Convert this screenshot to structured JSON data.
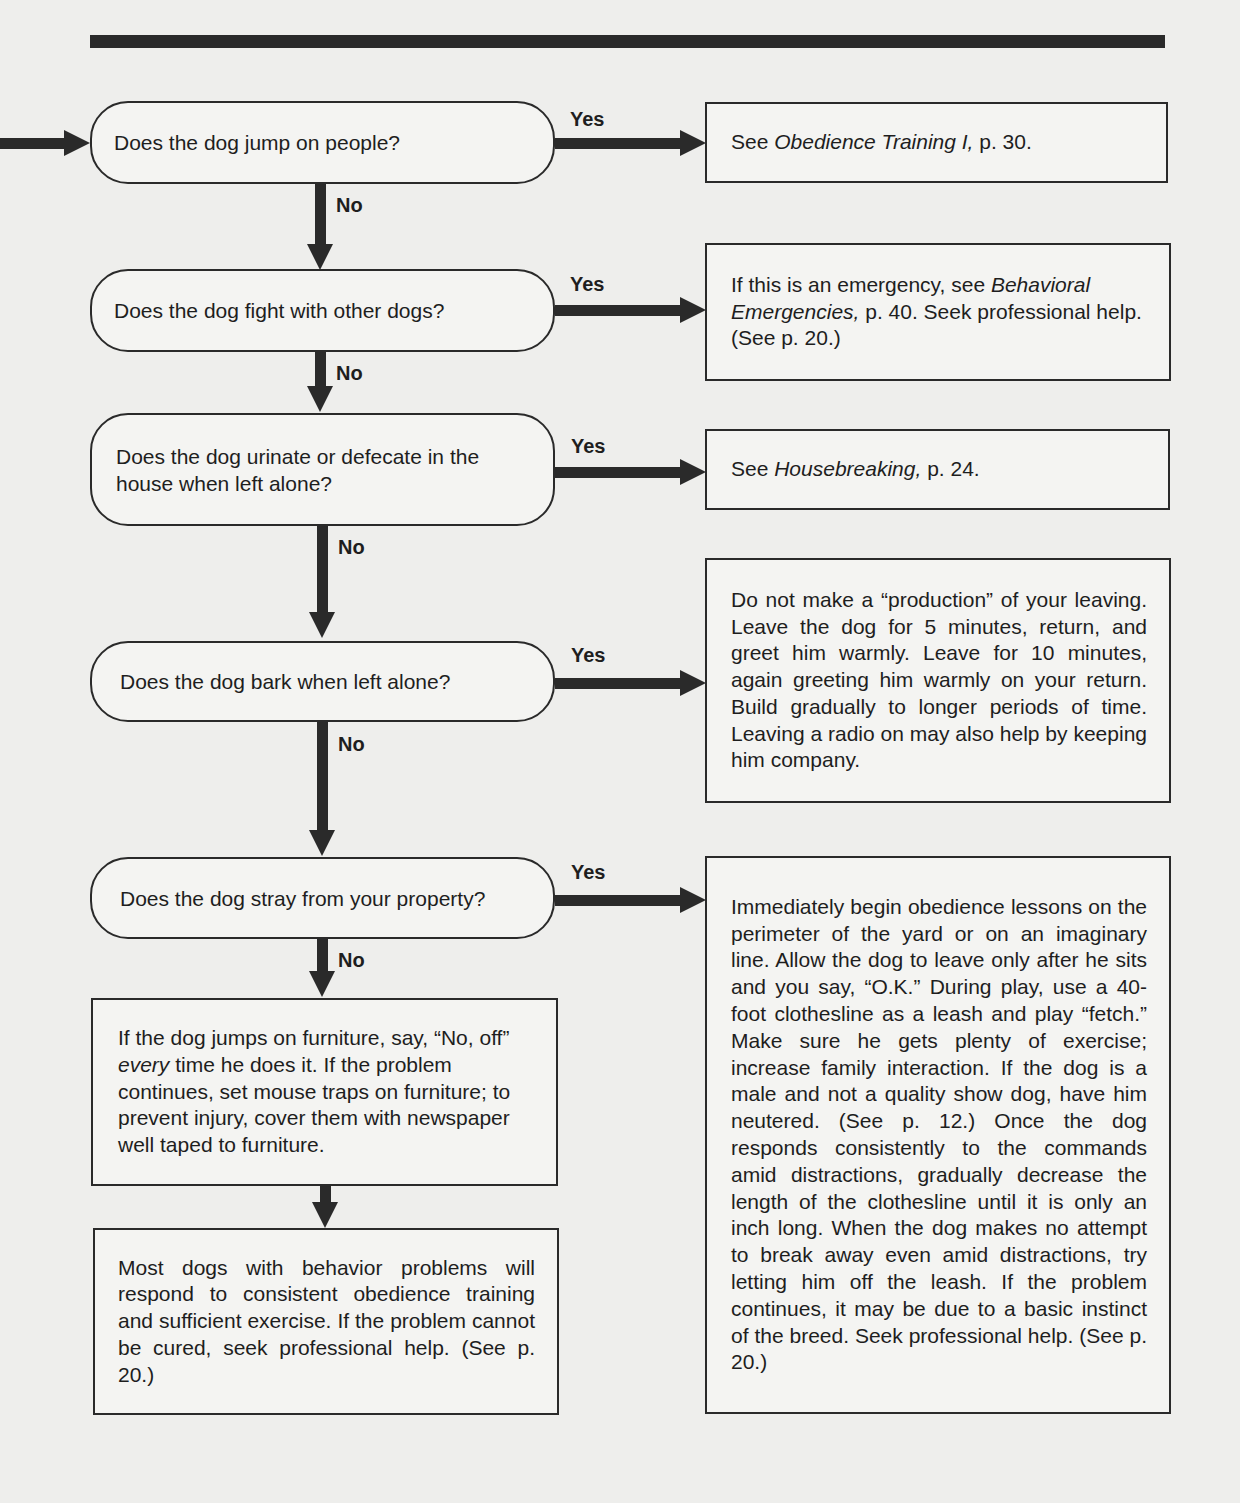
{
  "flowchart": {
    "questions": [
      {
        "text": "Does the dog jump on people?",
        "yes": "Yes",
        "no": "No"
      },
      {
        "text": "Does the dog fight with other dogs?",
        "yes": "Yes",
        "no": "No"
      },
      {
        "text": "Does the dog urinate or defecate in the house when left alone?",
        "yes": "Yes",
        "no": "No"
      },
      {
        "text": "Does the dog bark when left alone?",
        "yes": "Yes",
        "no": "No"
      },
      {
        "text": "Does the dog stray from your property?",
        "yes": "Yes",
        "no": "No"
      }
    ],
    "answers": [
      {
        "pre": "See ",
        "italic": "Obedience Training I,",
        "post": " p. 30."
      },
      {
        "pre": "If this is an emergency, see ",
        "italic": "Behavioral Emergencies,",
        "post": " p. 40. Seek professional help. (See p. 20.)"
      },
      {
        "pre": "See ",
        "italic": "Housebreaking,",
        "post": " p. 24."
      },
      {
        "text": "Do not make a “production” of your leaving. Leave the dog for 5 minutes, return, and greet him warmly. Leave for 10 minutes, again greeting him warmly on your return. Build gradually to longer periods of time. Leaving a radio on may also help by keeping him company."
      },
      {
        "text": "Immediately begin obedience lessons on the perimeter of the yard or on an imaginary line. Allow the dog to leave only after he sits and you say, “O.K.” During play, use a 40-foot clothesline as a leash and play “fetch.” Make sure he gets plenty of exercise; increase family interaction. If the dog is a male and not a quality show dog, have him neutered. (See p. 12.) Once the dog responds consistently to the commands amid distractions, gradually decrease the length of the clothesline until it is only an inch long. When the dog makes no attempt to break away even amid distractions, try letting him off the leash. If the problem continues, it may be due to a basic instinct of the breed. Seek professional help. (See p. 20.)"
      }
    ],
    "furniture": {
      "pre": "If the dog jumps on furniture, say, “No, off” ",
      "italic": "every",
      "post": " time he does it. If the problem continues, set mouse traps on furniture; to prevent injury, cover them with newspaper well taped to furniture."
    },
    "final": {
      "text": "Most dogs with behavior problems will respond to consistent obedience training and sufficient exercise. If the problem cannot be cured, seek professional help. (See p. 20.)"
    }
  }
}
